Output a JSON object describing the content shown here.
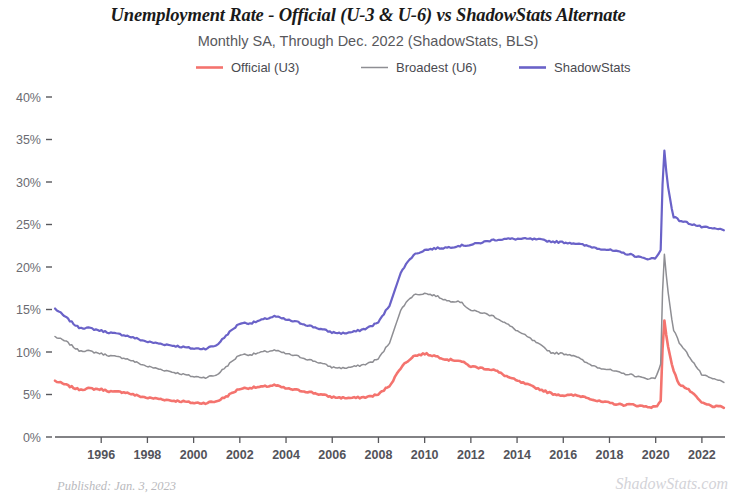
{
  "header": {
    "title": "Unemployment Rate - Official (U-3 & U-6) vs ShadowStats Alternate",
    "subtitle": "Monthly SA, Through Dec. 2022  (ShadowStats, BLS)"
  },
  "footer": {
    "published": "Published: Jan. 3, 2023",
    "watermark": "ShadowStats.com"
  },
  "chart_data": {
    "type": "line",
    "title": "Unemployment Rate - Official (U-3 & U-6) vs ShadowStats Alternate",
    "subtitle": "Monthly SA, Through Dec. 2022  (ShadowStats, BLS)",
    "xlabel": "",
    "ylabel": "",
    "xlim": [
      1994.0,
      2023.0
    ],
    "ylim": [
      0,
      40
    ],
    "grid": false,
    "legend_position": "top-center",
    "ytick_labels": [
      "0%",
      "5%",
      "10%",
      "15%",
      "20%",
      "25%",
      "30%",
      "35%",
      "40%"
    ],
    "ytick_values": [
      0,
      5,
      10,
      15,
      20,
      25,
      30,
      35,
      40
    ],
    "xtick_labels": [
      "1996",
      "1998",
      "2000",
      "2002",
      "2004",
      "2006",
      "2008",
      "2010",
      "2012",
      "2014",
      "2016",
      "2018",
      "2020",
      "2022"
    ],
    "xtick_values": [
      1996,
      1998,
      2000,
      2002,
      2004,
      2006,
      2008,
      2010,
      2012,
      2014,
      2016,
      2018,
      2020,
      2022
    ],
    "colors": {
      "official_u3": "#f4736e",
      "broadest_u6": "#8e8e93",
      "shadowstats": "#6a62c8",
      "axis": "#58585c"
    },
    "series": [
      {
        "name": "Official (U3)",
        "color": "#f4736e",
        "x": [
          1994.0,
          1994.5,
          1995.0,
          1995.5,
          1996.0,
          1996.5,
          1997.0,
          1997.5,
          1998.0,
          1998.5,
          1999.0,
          1999.5,
          2000.0,
          2000.5,
          2001.0,
          2001.5,
          2002.0,
          2002.5,
          2003.0,
          2003.5,
          2004.0,
          2004.5,
          2005.0,
          2005.5,
          2006.0,
          2006.5,
          2007.0,
          2007.5,
          2008.0,
          2008.5,
          2009.0,
          2009.5,
          2010.0,
          2010.5,
          2011.0,
          2011.5,
          2012.0,
          2012.5,
          2013.0,
          2013.5,
          2014.0,
          2014.5,
          2015.0,
          2015.5,
          2016.0,
          2016.5,
          2017.0,
          2017.5,
          2018.0,
          2018.5,
          2019.0,
          2019.5,
          2020.0,
          2020.25,
          2020.33,
          2020.5,
          2020.75,
          2021.0,
          2021.5,
          2022.0,
          2022.5,
          2022.95
        ],
        "values": [
          6.6,
          6.1,
          5.6,
          5.7,
          5.6,
          5.3,
          5.3,
          4.9,
          4.6,
          4.5,
          4.3,
          4.2,
          4.0,
          4.0,
          4.2,
          4.9,
          5.7,
          5.8,
          5.9,
          6.1,
          5.7,
          5.5,
          5.3,
          5.0,
          4.7,
          4.6,
          4.6,
          4.7,
          5.0,
          6.1,
          8.3,
          9.5,
          9.8,
          9.5,
          9.1,
          9.0,
          8.3,
          8.1,
          7.9,
          7.2,
          6.6,
          6.1,
          5.6,
          5.1,
          4.9,
          4.9,
          4.7,
          4.2,
          4.0,
          3.8,
          3.8,
          3.6,
          3.5,
          4.4,
          14.7,
          11.1,
          7.9,
          6.3,
          5.4,
          4.0,
          3.6,
          3.5
        ],
        "peak_2020": 14.7,
        "last_value": 3.5
      },
      {
        "name": "Broadest (U6)",
        "color": "#8e8e93",
        "x": [
          1994.0,
          1994.5,
          1995.0,
          1995.5,
          1996.0,
          1996.5,
          1997.0,
          1997.5,
          1998.0,
          1998.5,
          1999.0,
          1999.5,
          2000.0,
          2000.5,
          2001.0,
          2001.5,
          2002.0,
          2002.5,
          2003.0,
          2003.5,
          2004.0,
          2004.5,
          2005.0,
          2005.5,
          2006.0,
          2006.5,
          2007.0,
          2007.5,
          2008.0,
          2008.5,
          2009.0,
          2009.5,
          2010.0,
          2010.5,
          2011.0,
          2011.5,
          2012.0,
          2012.5,
          2013.0,
          2013.5,
          2014.0,
          2014.5,
          2015.0,
          2015.5,
          2016.0,
          2016.5,
          2017.0,
          2017.5,
          2018.0,
          2018.5,
          2019.0,
          2019.5,
          2020.0,
          2020.25,
          2020.33,
          2020.5,
          2020.75,
          2021.0,
          2021.5,
          2022.0,
          2022.5,
          2022.95
        ],
        "values": [
          11.8,
          11.2,
          10.2,
          10.1,
          9.8,
          9.5,
          9.3,
          8.8,
          8.3,
          8.0,
          7.7,
          7.4,
          7.1,
          7.0,
          7.3,
          8.5,
          9.7,
          9.7,
          10.0,
          10.2,
          9.8,
          9.5,
          9.1,
          8.7,
          8.2,
          8.1,
          8.3,
          8.6,
          9.2,
          11.2,
          15.2,
          16.7,
          16.9,
          16.6,
          16.0,
          16.0,
          14.9,
          14.6,
          14.2,
          13.4,
          12.5,
          11.7,
          10.8,
          9.9,
          9.8,
          9.6,
          8.7,
          8.2,
          7.9,
          7.5,
          7.3,
          6.9,
          6.9,
          8.9,
          22.9,
          17.8,
          12.8,
          11.2,
          9.3,
          7.3,
          6.8,
          6.5
        ],
        "peak_2020": 22.9,
        "last_value": 6.5
      },
      {
        "name": "ShadowStats",
        "color": "#6a62c8",
        "x": [
          1994.0,
          1994.5,
          1995.0,
          1995.5,
          1996.0,
          1996.5,
          1997.0,
          1997.5,
          1998.0,
          1998.5,
          1999.0,
          1999.5,
          2000.0,
          2000.5,
          2001.0,
          2001.5,
          2002.0,
          2002.5,
          2003.0,
          2003.5,
          2004.0,
          2004.5,
          2005.0,
          2005.5,
          2006.0,
          2006.5,
          2007.0,
          2007.5,
          2008.0,
          2008.5,
          2009.0,
          2009.5,
          2010.0,
          2010.5,
          2011.0,
          2011.5,
          2012.0,
          2012.5,
          2013.0,
          2013.5,
          2014.0,
          2014.5,
          2015.0,
          2015.5,
          2016.0,
          2016.5,
          2017.0,
          2017.5,
          2018.0,
          2018.5,
          2019.0,
          2019.5,
          2020.0,
          2020.25,
          2020.33,
          2020.5,
          2020.75,
          2021.0,
          2021.5,
          2022.0,
          2022.5,
          2022.95
        ],
        "values": [
          15.1,
          14.0,
          12.9,
          12.8,
          12.5,
          12.2,
          12.0,
          11.6,
          11.2,
          11.0,
          10.8,
          10.6,
          10.4,
          10.4,
          10.8,
          12.2,
          13.4,
          13.4,
          13.8,
          14.2,
          13.8,
          13.5,
          13.1,
          12.7,
          12.3,
          12.2,
          12.4,
          12.8,
          13.5,
          15.6,
          19.6,
          21.4,
          22.0,
          22.2,
          22.3,
          22.5,
          22.6,
          22.9,
          23.2,
          23.3,
          23.3,
          23.3,
          23.2,
          23.0,
          22.9,
          22.8,
          22.5,
          22.2,
          22.0,
          21.7,
          21.4,
          21.0,
          21.0,
          22.2,
          35.1,
          30.0,
          26.0,
          25.5,
          25.1,
          24.7,
          24.5,
          24.4
        ],
        "peak_2020": 35.1,
        "last_value": 24.4
      }
    ]
  },
  "legend": {
    "items": [
      {
        "label": "Official (U3)",
        "color": "#f4736e"
      },
      {
        "label": "Broadest (U6)",
        "color": "#8e8e93"
      },
      {
        "label": "ShadowStats",
        "color": "#6a62c8"
      }
    ]
  }
}
